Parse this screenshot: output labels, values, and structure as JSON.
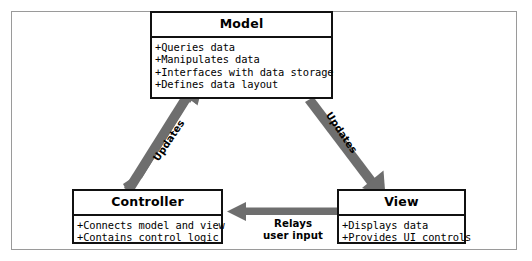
{
  "diagram": {
    "type": "uml-class-relationship",
    "title_text": "",
    "accent_arrow_color": "#6e6e6e",
    "box_border_color": "#111111",
    "frame_color": "#9a9a9a",
    "boxes": [
      {
        "id": "model",
        "title": "Model",
        "items": [
          "+Queries data",
          "+Manipulates data",
          "+Interfaces with data storage",
          "+Defines data layout"
        ]
      },
      {
        "id": "controller",
        "title": "Controller",
        "items": [
          "+Connects model and view",
          "+Contains control logic"
        ]
      },
      {
        "id": "view",
        "title": "View",
        "items": [
          "+Displays data",
          "+Provides UI controls"
        ]
      }
    ],
    "arrows": [
      {
        "id": "controller-to-model",
        "label": "Updates",
        "from": "controller",
        "to": "model"
      },
      {
        "id": "model-to-view",
        "label": "Updates",
        "from": "model",
        "to": "view"
      },
      {
        "id": "view-to-controller",
        "label_line1": "Relays",
        "label_line2": "user input",
        "from": "view",
        "to": "controller"
      }
    ]
  }
}
